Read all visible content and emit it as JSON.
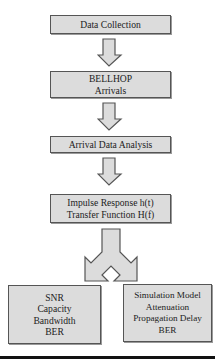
{
  "diagram": {
    "type": "flowchart",
    "colors": {
      "box_fill": "#dcdcdc",
      "box_border": "#555555",
      "arrow_fill": "#dcdcdc",
      "arrow_stroke": "#555555",
      "rule": "#111111"
    },
    "steps": [
      {
        "id": "data-collection",
        "lines": [
          "Data Collection"
        ]
      },
      {
        "id": "bellhop-arrivals",
        "lines": [
          "BELLHOP",
          "Arrivals"
        ]
      },
      {
        "id": "arrival-data-analysis",
        "lines": [
          "Arrival Data Analysis"
        ]
      },
      {
        "id": "impulse-transfer",
        "lines": [
          "Impulse Response h(t)",
          "Transfer Function H(f)"
        ]
      }
    ],
    "outputs": [
      {
        "id": "channel-metrics",
        "lines": [
          "SNR",
          "Capacity",
          "Bandwidth",
          "BER"
        ]
      },
      {
        "id": "simulation-model",
        "lines": [
          "Simulation Model",
          "Attenuation",
          "Propagation Delay",
          "BER"
        ]
      }
    ],
    "edges": [
      {
        "from": "data-collection",
        "to": "bellhop-arrivals",
        "style": "block-arrow"
      },
      {
        "from": "bellhop-arrivals",
        "to": "arrival-data-analysis",
        "style": "block-arrow"
      },
      {
        "from": "arrival-data-analysis",
        "to": "impulse-transfer",
        "style": "block-arrow"
      },
      {
        "from": "impulse-transfer",
        "to": [
          "channel-metrics",
          "simulation-model"
        ],
        "style": "split-block-arrow"
      }
    ]
  }
}
